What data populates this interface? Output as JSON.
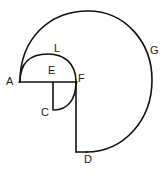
{
  "figure": {
    "canvas": {
      "width": 165,
      "height": 175
    },
    "stroke_color": "#111111",
    "background_color": "#ffffff",
    "stroke_width": 1.6,
    "labels": [
      {
        "id": "A",
        "text": "A",
        "x": 6,
        "y": 76
      },
      {
        "id": "L",
        "text": "L",
        "x": 54,
        "y": 43
      },
      {
        "id": "G",
        "text": "G",
        "x": 150,
        "y": 45
      },
      {
        "id": "E",
        "text": "E",
        "x": 48,
        "y": 65
      },
      {
        "id": "F",
        "text": "F",
        "x": 78,
        "y": 73
      },
      {
        "id": "C",
        "text": "C",
        "x": 41,
        "y": 107
      },
      {
        "id": "D",
        "text": "D",
        "x": 84,
        "y": 154
      }
    ],
    "points": {
      "A": {
        "x": 20,
        "y": 82
      },
      "E": {
        "x": 53,
        "y": 82
      },
      "F": {
        "x": 76,
        "y": 82
      },
      "C": {
        "x": 53,
        "y": 110
      },
      "D": {
        "x": 76,
        "y": 152
      },
      "G": {
        "x": 152,
        "y": 80
      },
      "L": {
        "x": 48,
        "y": 54
      }
    },
    "strokes": [
      {
        "id": "segment-AF",
        "kind": "line",
        "desc": "horizontal segment from A through E to F"
      },
      {
        "id": "segment-EC",
        "kind": "line",
        "desc": "vertical segment from E down to C"
      },
      {
        "id": "segment-FD",
        "kind": "line",
        "desc": "vertical segment from F down to D"
      },
      {
        "id": "arc-AF-L",
        "kind": "arc",
        "desc": "semicircle above AF passing through L"
      },
      {
        "id": "arc-FC",
        "kind": "arc",
        "desc": "quarter arc from F curving down-left to C"
      },
      {
        "id": "arc-AGD",
        "kind": "arc",
        "desc": "large spiral arc from A over the top through G down to D"
      }
    ]
  }
}
